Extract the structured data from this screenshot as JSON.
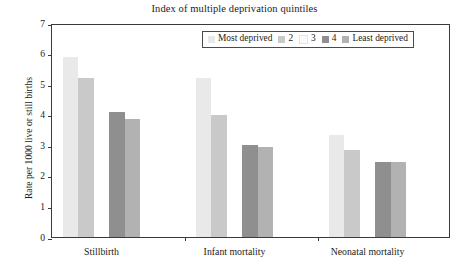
{
  "chart_data": {
    "type": "bar",
    "title": "Index of multiple deprivation quintiles",
    "xlabel": "",
    "ylabel": "Rate per 1000 live or still births",
    "categories": [
      "Stillbirth",
      "Infant mortality",
      "Neonatal mortality"
    ],
    "series": [
      {
        "name": "Most deprived",
        "color": "#e9e9e9",
        "values": [
          5.9,
          5.2,
          3.35
        ]
      },
      {
        "name": "2",
        "color": "#c9c9c9",
        "values": [
          5.2,
          4.0,
          2.85
        ]
      },
      {
        "name": "3",
        "color": "#fbfbfb",
        "values": [
          0.0,
          0.0,
          0.0
        ]
      },
      {
        "name": "4",
        "color": "#8f8f8f",
        "values": [
          4.1,
          3.0,
          2.45
        ]
      },
      {
        "name": "Least deprived",
        "color": "#b2b2b2",
        "values": [
          3.85,
          2.95,
          2.45
        ]
      }
    ],
    "ylim": [
      0,
      7
    ],
    "yticks": [
      0,
      1,
      2,
      3,
      4,
      5,
      6,
      7
    ],
    "ytick_labels": [
      "0",
      "1",
      "2",
      "3",
      "4",
      "5",
      "6",
      "7"
    ],
    "grid": false,
    "legend_position": "top-center-inside",
    "legend_entries": [
      "Most deprived",
      "2",
      "3",
      "4",
      "Least deprived"
    ]
  }
}
